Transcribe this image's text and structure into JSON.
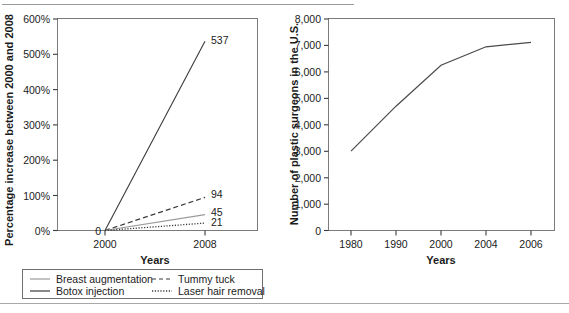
{
  "chart_data": [
    {
      "id": "left",
      "type": "line",
      "title": "",
      "xlabel": "Years",
      "ylabel": "Percentage increase between 2000 and 2008",
      "x": [
        2000,
        2008
      ],
      "xtick_labels": [
        "2000",
        "2008"
      ],
      "ytick_labels": [
        "0%",
        "100%",
        "200%",
        "300%",
        "400%",
        "500%",
        "600%"
      ],
      "yticks": [
        0,
        100,
        200,
        300,
        400,
        500,
        600
      ],
      "ylim": [
        0,
        600
      ],
      "grid": false,
      "origin_label": "0",
      "series": [
        {
          "name": "Breast augmentation",
          "style": "solid-gray",
          "values": [
            0,
            45
          ],
          "end_label": "45",
          "color": "#8d8d8d"
        },
        {
          "name": "Botox injection",
          "style": "solid-dark",
          "values": [
            0,
            537
          ],
          "end_label": "537",
          "color": "#3a3a3a"
        },
        {
          "name": "Tummy tuck",
          "style": "dashed",
          "values": [
            0,
            94
          ],
          "end_label": "94",
          "color": "#3a3a3a"
        },
        {
          "name": "Laser hair removal",
          "style": "dotted",
          "values": [
            0,
            21
          ],
          "end_label": "21",
          "color": "#3a3a3a"
        }
      ],
      "legend": {
        "position": "below",
        "entries": [
          "Breast augmentation",
          "Botox injection",
          "Tummy tuck",
          "Laser hair removal"
        ]
      }
    },
    {
      "id": "right",
      "type": "line",
      "title": "",
      "xlabel": "Years",
      "ylabel": "Number of plastic surgeons in the U.S.",
      "x": [
        1980,
        1990,
        2000,
        2004,
        2006
      ],
      "xtick_labels": [
        "1980",
        "1990",
        "2000",
        "2004",
        "2006"
      ],
      "ytick_labels": [
        "0",
        "1,000",
        "2,000",
        "3,000",
        "4,000",
        "5,000",
        "6,000",
        "7,000",
        "8,000"
      ],
      "yticks": [
        0,
        1000,
        2000,
        3000,
        4000,
        5000,
        6000,
        7000,
        8000
      ],
      "ylim": [
        0,
        8000
      ],
      "grid": false,
      "series": [
        {
          "name": "Number of plastic surgeons",
          "style": "solid-dark",
          "color": "#4a4a4a",
          "values": [
            3000,
            4700,
            6250,
            6950,
            7120
          ]
        }
      ]
    }
  ]
}
